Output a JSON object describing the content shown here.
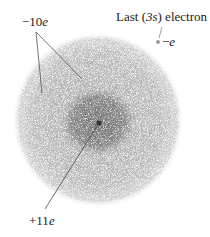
{
  "diagram": {
    "labels": {
      "inner_electrons": {
        "sign": "−",
        "number": "10",
        "symbol": "e"
      },
      "last_electron_caption_prefix": "Last (",
      "last_electron_orbital": "3s",
      "last_electron_caption_suffix": ") electron",
      "last_electron_charge": {
        "sign": "−",
        "symbol": "e"
      },
      "nucleus": {
        "sign": "+",
        "number": "11",
        "symbol": "e"
      }
    },
    "colors": {
      "outer_cloud": "#b8b8b8",
      "inner_cloud": "#8a8a8a",
      "nucleus": "#333333",
      "valence_electron": "#9a9a9a",
      "leader_lines": "#555555",
      "text": "#222222"
    }
  }
}
